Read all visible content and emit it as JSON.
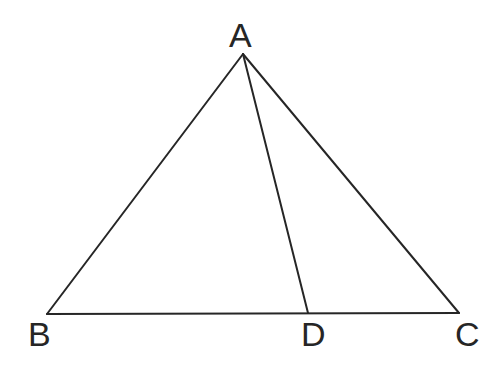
{
  "figure": {
    "kind": "geometry-diagram",
    "background_color": "#ffffff",
    "stroke_color": "#262626",
    "stroke_width": 2,
    "label_color": "#262626",
    "width": 503,
    "height": 369
  },
  "points": {
    "A": {
      "label": "A",
      "x": 243,
      "y": 54
    },
    "B": {
      "label": "B",
      "x": 47,
      "y": 314
    },
    "C": {
      "label": "C",
      "x": 459,
      "y": 313
    },
    "D": {
      "label": "D",
      "x": 308,
      "y": 313
    }
  },
  "segments": [
    {
      "name": "AB",
      "from": "A",
      "to": "B",
      "x1": 243,
      "y1": 54,
      "x2": 47,
      "y2": 314
    },
    {
      "name": "AC",
      "from": "A",
      "to": "C",
      "x1": 243,
      "y1": 54,
      "x2": 459,
      "y2": 313
    },
    {
      "name": "BC",
      "from": "B",
      "to": "C",
      "x1": 47,
      "y1": 314,
      "x2": 459,
      "y2": 313
    },
    {
      "name": "AD",
      "from": "A",
      "to": "D",
      "x1": 243,
      "y1": 54,
      "x2": 308,
      "y2": 313
    }
  ],
  "labels": {
    "A": "A",
    "B": "B",
    "C": "C",
    "D": "D"
  }
}
